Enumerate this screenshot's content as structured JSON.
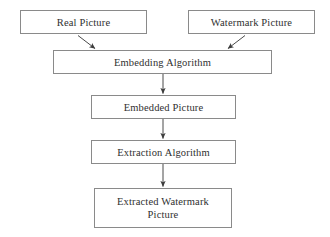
{
  "diagram": {
    "background_color": "#ffffff",
    "border_color": "#8a8a8a",
    "text_color": "#2f2f2f",
    "arrow_color": "#4a4a4a",
    "nodes": [
      {
        "id": "real_picture",
        "label": "Real Picture"
      },
      {
        "id": "watermark_picture",
        "label": "Watermark Picture"
      },
      {
        "id": "embedding_algorithm",
        "label": "Embedding Algorithm"
      },
      {
        "id": "embedded_picture",
        "label": "Embedded Picture"
      },
      {
        "id": "extraction_algorithm",
        "label": "Extraction Algorithm"
      },
      {
        "id": "extracted_watermark",
        "label": "Extracted Watermark\nPicture"
      }
    ],
    "edges": [
      {
        "id": "edge_real_to_embedding",
        "from": "real_picture",
        "to": "embedding_algorithm",
        "style": "diagonal-arrow"
      },
      {
        "id": "edge_watermark_to_embedding",
        "from": "watermark_picture",
        "to": "embedding_algorithm",
        "style": "diagonal-arrow"
      },
      {
        "id": "edge_embedding_to_embedded",
        "from": "embedding_algorithm",
        "to": "embedded_picture",
        "style": "vertical-arrow"
      },
      {
        "id": "edge_embedded_to_extraction",
        "from": "embedded_picture",
        "to": "extraction_algorithm",
        "style": "vertical-arrow"
      },
      {
        "id": "edge_extraction_to_output",
        "from": "extraction_algorithm",
        "to": "extracted_watermark",
        "style": "vertical-arrow"
      }
    ]
  }
}
